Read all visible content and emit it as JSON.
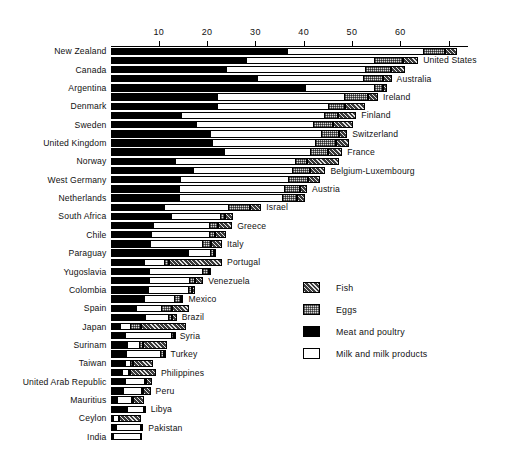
{
  "chart_data": {
    "type": "bar",
    "orientation": "horizontal",
    "stacked": true,
    "title": "",
    "xlabel": "",
    "ylabel": "",
    "xlim": [
      0,
      74
    ],
    "grid": false,
    "axis_position": "top",
    "tick_labels": [
      "10",
      "20",
      "30",
      "40",
      "50",
      "60",
      ""
    ],
    "ticks": [
      10,
      20,
      30,
      40,
      50,
      60,
      70
    ],
    "legend": {
      "position": "middle-right",
      "entries": [
        {
          "key": "fish",
          "label": "Fish",
          "swatch": "dark-crosshatch"
        },
        {
          "key": "eggs",
          "label": "Eggs",
          "swatch": "light-stipple"
        },
        {
          "key": "meat",
          "label": "Meat and poultry",
          "swatch": "solid-black"
        },
        {
          "key": "milk",
          "label": "Milk and milk products",
          "swatch": "white-outline"
        }
      ]
    },
    "series_order": [
      "meat",
      "milk",
      "eggs",
      "fish"
    ],
    "categories": [
      "New Zealand",
      "United States",
      "Canada",
      "Australia",
      "Argentina",
      "Ireland",
      "Denmark",
      "Finland",
      "Sweden",
      "Switzerland",
      "United Kingdom",
      "France",
      "Norway",
      "Belgium-Luxembourg",
      "West Germany",
      "Austria",
      "Netherlands",
      "Israel",
      "South Africa",
      "Greece",
      "Chile",
      "Italy",
      "Paraguay",
      "Portugal",
      "Yugoslavia",
      "Venezuela",
      "Colombia",
      "Mexico",
      "Spain",
      "Brazil",
      "Japan",
      "Syria",
      "Surinam",
      "Turkey",
      "Taiwan",
      "Philippines",
      "United Arab Republic",
      "Peru",
      "Mauritius",
      "Libya",
      "Ceylon",
      "Pakistan",
      "India"
    ],
    "rows": [
      {
        "name": "New Zealand",
        "side": "left",
        "meat": 36.5,
        "milk": 28.1,
        "eggs": 4.6,
        "fish": 2.5
      },
      {
        "name": "United States",
        "side": "right",
        "meat": 28.0,
        "milk": 26.5,
        "eggs": 6.1,
        "fish": 3.1
      },
      {
        "name": "Canada",
        "side": "left",
        "meat": 24.0,
        "milk": 28.6,
        "eggs": 5.4,
        "fish": 3.0
      },
      {
        "name": "Australia",
        "side": "right",
        "meat": 30.4,
        "milk": 21.9,
        "eggs": 4.1,
        "fish": 1.8
      },
      {
        "name": "Argentina",
        "side": "left",
        "meat": 40.2,
        "milk": 14.3,
        "eggs": 1.9,
        "fish": 0.8
      },
      {
        "name": "Ireland",
        "side": "right",
        "meat": 22.1,
        "milk": 26.3,
        "eggs": 5.0,
        "fish": 2.0
      },
      {
        "name": "Denmark",
        "side": "left",
        "meat": 22.0,
        "milk": 23.0,
        "eggs": 3.5,
        "fish": 4.2
      },
      {
        "name": "Finland",
        "side": "right",
        "meat": 14.6,
        "milk": 29.5,
        "eggs": 3.0,
        "fish": 3.8
      },
      {
        "name": "Sweden",
        "side": "left",
        "meat": 17.6,
        "milk": 24.4,
        "eggs": 4.0,
        "fish": 4.3
      },
      {
        "name": "Switzerland",
        "side": "right",
        "meat": 20.6,
        "milk": 23.0,
        "eggs": 3.8,
        "fish": 1.6
      },
      {
        "name": "United Kingdom",
        "side": "left",
        "meat": 21.0,
        "milk": 21.3,
        "eggs": 4.4,
        "fish": 2.6
      },
      {
        "name": "France",
        "side": "right",
        "meat": 23.5,
        "milk": 17.9,
        "eggs": 3.6,
        "fish": 3.0
      },
      {
        "name": "Norway",
        "side": "left",
        "meat": 13.3,
        "milk": 24.8,
        "eggs": 2.6,
        "fish": 6.6
      },
      {
        "name": "Belgium-Luxembourg",
        "side": "right",
        "meat": 17.1,
        "milk": 20.5,
        "eggs": 3.8,
        "fish": 3.1
      },
      {
        "name": "West Germany",
        "side": "left",
        "meat": 14.4,
        "milk": 22.3,
        "eggs": 4.2,
        "fish": 2.4
      },
      {
        "name": "Austria",
        "side": "right",
        "meat": 14.2,
        "milk": 21.8,
        "eggs": 3.2,
        "fish": 1.5
      },
      {
        "name": "Netherlands",
        "side": "left",
        "meat": 14.1,
        "milk": 21.4,
        "eggs": 3.1,
        "fish": 1.7
      },
      {
        "name": "Israel",
        "side": "right",
        "meat": 11.1,
        "milk": 13.2,
        "eggs": 4.5,
        "fish": 2.4
      },
      {
        "name": "South Africa",
        "side": "left",
        "meat": 12.5,
        "milk": 10.2,
        "eggs": 1.1,
        "fish": 1.5
      },
      {
        "name": "Greece",
        "side": "right",
        "meat": 8.8,
        "milk": 11.6,
        "eggs": 1.8,
        "fish": 3.0
      },
      {
        "name": "Chile",
        "side": "left",
        "meat": 8.4,
        "milk": 11.9,
        "eggs": 1.3,
        "fish": 2.3
      },
      {
        "name": "Italy",
        "side": "right",
        "meat": 8.2,
        "milk": 10.7,
        "eggs": 2.0,
        "fish": 2.2
      },
      {
        "name": "Paraguay",
        "side": "left",
        "meat": 16.0,
        "milk": 4.6,
        "eggs": 0.9,
        "fish": 0.4
      },
      {
        "name": "Portugal",
        "side": "right",
        "meat": 6.9,
        "milk": 4.2,
        "eggs": 1.0,
        "fish": 11.0
      },
      {
        "name": "Yugoslavia",
        "side": "left",
        "meat": 7.9,
        "milk": 11.0,
        "eggs": 1.5,
        "fish": 0.5
      },
      {
        "name": "Venezuela",
        "side": "right",
        "meat": 8.0,
        "milk": 8.2,
        "eggs": 1.2,
        "fish": 1.8
      },
      {
        "name": "Colombia",
        "side": "left",
        "meat": 7.8,
        "milk": 8.2,
        "eggs": 0.9,
        "fish": 0.5
      },
      {
        "name": "Mexico",
        "side": "right",
        "meat": 6.9,
        "milk": 6.3,
        "eggs": 1.3,
        "fish": 0.6
      },
      {
        "name": "Spain",
        "side": "left",
        "meat": 5.3,
        "milk": 5.2,
        "eggs": 2.2,
        "fish": 3.6
      },
      {
        "name": "Brazil",
        "side": "right",
        "meat": 7.1,
        "milk": 4.8,
        "eggs": 0.9,
        "fish": 0.9
      },
      {
        "name": "Japan",
        "side": "left",
        "meat": 2.0,
        "milk": 2.1,
        "eggs": 2.3,
        "fish": 9.3
      },
      {
        "name": "Syria",
        "side": "right",
        "meat": 3.1,
        "milk": 9.4,
        "eggs": 0.6,
        "fish": 0.2
      },
      {
        "name": "Surinam",
        "side": "left",
        "meat": 3.4,
        "milk": 2.6,
        "eggs": 0.7,
        "fish": 4.9
      },
      {
        "name": "Turkey",
        "side": "right",
        "meat": 3.3,
        "milk": 7.0,
        "eggs": 0.7,
        "fish": 0.4
      },
      {
        "name": "Taiwan",
        "side": "left",
        "meat": 3.0,
        "milk": 1.1,
        "eggs": 0.6,
        "fish": 4.2
      },
      {
        "name": "Philippines",
        "side": "right",
        "meat": 2.4,
        "milk": 1.2,
        "eggs": 0.5,
        "fish": 5.3
      },
      {
        "name": "United Arab Republic",
        "side": "left",
        "meat": 2.9,
        "milk": 4.0,
        "eggs": 0.4,
        "fish": 1.2
      },
      {
        "name": "Peru",
        "side": "right",
        "meat": 2.6,
        "milk": 3.7,
        "eggs": 0.5,
        "fish": 1.5
      },
      {
        "name": "Mauritius",
        "side": "left",
        "meat": 1.3,
        "milk": 3.0,
        "eggs": 0.4,
        "fish": 2.2
      },
      {
        "name": "Libya",
        "side": "right",
        "meat": 3.4,
        "milk": 3.4,
        "eggs": 0.2,
        "fish": 0.3
      },
      {
        "name": "Ceylon",
        "side": "left",
        "meat": 0.5,
        "milk": 1.0,
        "eggs": 0.3,
        "fish": 4.5
      },
      {
        "name": "Pakistan",
        "side": "right",
        "meat": 1.1,
        "milk": 5.0,
        "eggs": 0.2,
        "fish": 0.5
      },
      {
        "name": "India",
        "side": "left",
        "meat": 0.5,
        "milk": 5.6,
        "eggs": 0.1,
        "fish": 0.3
      }
    ]
  }
}
